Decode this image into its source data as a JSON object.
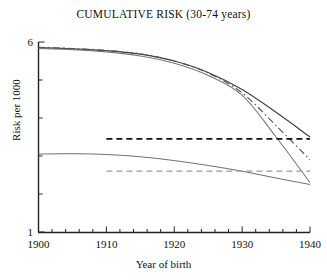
{
  "chart_data": {
    "type": "line",
    "title": "CUMULATIVE RISK (30-74 years)",
    "xlabel": "Year of birth",
    "ylabel": "Risk per 1000",
    "xlim": [
      1900,
      1940
    ],
    "ylim": [
      1,
      6
    ],
    "grid": false,
    "legend": "none",
    "xticks": [
      1900,
      1910,
      1920,
      1930,
      1940
    ],
    "xtick_labels": [
      "1900",
      "1910",
      "1920",
      "1930",
      "1940"
    ],
    "xminor_step": 2,
    "yticks": [
      1,
      2,
      3,
      4,
      5,
      6
    ],
    "ytick_labels": [
      "1",
      "",
      "",
      "",
      "",
      "6"
    ],
    "series": [
      {
        "name": "upper-solid-dark",
        "style": "solid",
        "color": "#3c3c3c",
        "width": 1.1,
        "x": [
          1900,
          1905,
          1910,
          1915,
          1920,
          1925,
          1930,
          1935,
          1940
        ],
        "values": [
          5.85,
          5.82,
          5.77,
          5.68,
          5.5,
          5.2,
          4.75,
          4.15,
          3.5
        ]
      },
      {
        "name": "upper-solid-gray",
        "style": "solid",
        "color": "#7a7a7a",
        "width": 1.1,
        "x": [
          1900,
          1905,
          1910,
          1915,
          1920,
          1925,
          1930,
          1935,
          1940
        ],
        "values": [
          5.83,
          5.8,
          5.74,
          5.63,
          5.44,
          5.12,
          4.6,
          3.5,
          2.3
        ]
      },
      {
        "name": "upper-dash-dot",
        "style": "dashdot",
        "color": "#555555",
        "width": 1.1,
        "x": [
          1900,
          1905,
          1910,
          1915,
          1920,
          1925,
          1930,
          1935,
          1940
        ],
        "values": [
          5.86,
          5.83,
          5.78,
          5.69,
          5.5,
          5.18,
          4.66,
          3.8,
          2.9
        ]
      },
      {
        "name": "upper-flat-dashed",
        "style": "dashed",
        "color": "#111111",
        "width": 1.6,
        "x": [
          1910,
          1940
        ],
        "values": [
          3.45,
          3.45
        ]
      },
      {
        "name": "lower-solid-gray",
        "style": "solid",
        "color": "#6f6f6f",
        "width": 1.0,
        "x": [
          1900,
          1905,
          1910,
          1915,
          1920,
          1925,
          1930,
          1935,
          1940
        ],
        "values": [
          3.05,
          3.06,
          3.04,
          2.98,
          2.88,
          2.75,
          2.6,
          2.42,
          2.25
        ]
      },
      {
        "name": "lower-flat-dashed",
        "style": "dashed",
        "color": "#9a9a9a",
        "width": 1.2,
        "x": [
          1910,
          1940
        ],
        "values": [
          2.6,
          2.6
        ]
      }
    ]
  },
  "axes": {
    "y_top_label": "6",
    "y_bottom_label": "1",
    "x_first_label": "1900",
    "x_last_label": "1940"
  }
}
